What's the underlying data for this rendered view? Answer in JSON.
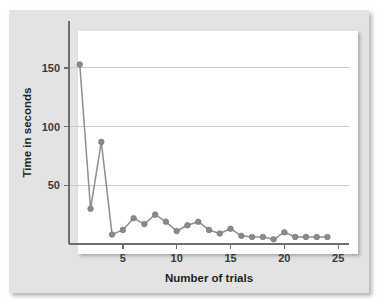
{
  "figure": {
    "background_color": "#e3e3e3",
    "panel_color": "#ffffff",
    "series_color": "#8a8a8a",
    "gridline_color": "#c8c8c8",
    "axis_color": "#6e6e6e"
  },
  "chart_data": {
    "type": "line",
    "title": "",
    "subtitle": "",
    "xlabel": "Number of trials",
    "ylabel": "Time in seconds",
    "x": [
      1,
      2,
      3,
      4,
      5,
      6,
      7,
      8,
      9,
      10,
      11,
      12,
      13,
      14,
      15,
      16,
      17,
      18,
      19,
      20,
      21,
      22,
      23,
      24
    ],
    "values": [
      153,
      30,
      87,
      8,
      12,
      22,
      17,
      25,
      19,
      11,
      16,
      19,
      12,
      9,
      13,
      7,
      6,
      6,
      4,
      10,
      6,
      6,
      6,
      6
    ],
    "series": [
      {
        "name": "Time in seconds",
        "values": [
          153,
          30,
          87,
          8,
          12,
          22,
          17,
          25,
          19,
          11,
          16,
          19,
          12,
          9,
          13,
          7,
          6,
          6,
          4,
          10,
          6,
          6,
          6,
          6
        ]
      }
    ],
    "xlim": [
      0,
      26
    ],
    "ylim": [
      0,
      190
    ],
    "xticks": [
      5,
      10,
      15,
      20,
      25
    ],
    "xtick_labels": [
      "5",
      "10",
      "15",
      "20",
      "25"
    ],
    "yticks": [
      50,
      100,
      150
    ],
    "ytick_labels": [
      "50",
      "100",
      "150"
    ],
    "grid": "horizontal",
    "legend": "none",
    "markers": "circle",
    "annotations": []
  }
}
